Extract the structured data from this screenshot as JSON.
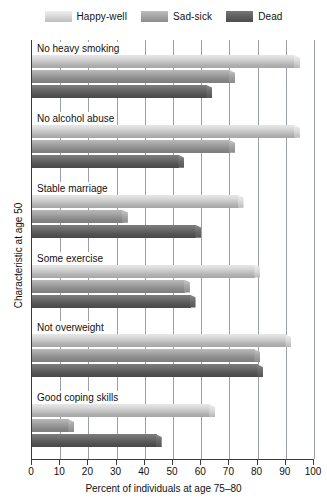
{
  "legend": {
    "position": "top",
    "entries": [
      {
        "label": "Happy-well",
        "color": "#c9c9c9",
        "icon": "legend-swatch"
      },
      {
        "label": "Sad-sick",
        "color": "#9a9a9a",
        "icon": "legend-swatch"
      },
      {
        "label": "Dead",
        "color": "#5e5e5e",
        "icon": "legend-swatch"
      }
    ]
  },
  "chart_data": {
    "type": "bar",
    "orientation": "horizontal",
    "title": "",
    "subtitle": "",
    "xlabel": "Percent of individuals at age 75–80",
    "ylabel": "Characteristic at age 50",
    "xlim": [
      0,
      100
    ],
    "xticks": [
      0,
      10,
      20,
      30,
      40,
      50,
      60,
      70,
      80,
      90,
      100
    ],
    "xtick_labels": [
      "0",
      "10",
      "20",
      "30",
      "40",
      "50",
      "60",
      "70",
      "80",
      "90",
      "100"
    ],
    "grid": "vertical",
    "legend_position": "top",
    "categories": [
      "No heavy smoking",
      "No alcohol abuse",
      "Stable marriage",
      "Some exercise",
      "Not overweight",
      "Good coping skills"
    ],
    "series": [
      {
        "name": "Happy-well",
        "color": "#c9c9c9",
        "values": [
          95,
          95,
          75,
          81,
          92,
          65
        ]
      },
      {
        "name": "Sad-sick",
        "color": "#9a9a9a",
        "values": [
          72,
          72,
          34,
          56,
          81,
          15
        ]
      },
      {
        "name": "Dead",
        "color": "#5e5e5e",
        "values": [
          64,
          54,
          60,
          58,
          82,
          46
        ]
      }
    ]
  }
}
